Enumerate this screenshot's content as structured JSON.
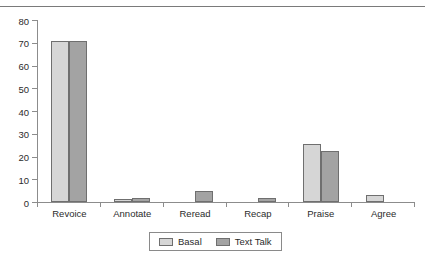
{
  "figure": {
    "clipped_caption": "",
    "top_rule": true
  },
  "legend": {
    "position": "bottom-center",
    "entries": [
      {
        "label": "Basal",
        "color": "#d6d6d6"
      },
      {
        "label": "Text Talk",
        "color": "#a3a3a3"
      }
    ]
  },
  "chart_data": {
    "type": "bar",
    "title": "",
    "subtitle": "",
    "xlabel": "",
    "ylabel": "",
    "categories": [
      "Revoice",
      "Annotate",
      "Reread",
      "Recap",
      "Praise",
      "Agree"
    ],
    "series": [
      {
        "name": "Basal",
        "color": "#d6d6d6",
        "values": [
          70.8,
          1.3,
          0,
          0,
          25.4,
          3.2
        ]
      },
      {
        "name": "Text Talk",
        "color": "#a3a3a3",
        "values": [
          70.8,
          1.7,
          4.7,
          1.8,
          22.4,
          0
        ]
      }
    ],
    "ylim": [
      0,
      80
    ],
    "yticks": [
      0,
      10,
      20,
      30,
      40,
      50,
      60,
      70,
      80
    ],
    "ytick_labels": [
      "0",
      "10",
      "20",
      "30",
      "40",
      "50",
      "60",
      "70",
      "80"
    ],
    "grid": false,
    "legend_position": "bottom"
  }
}
